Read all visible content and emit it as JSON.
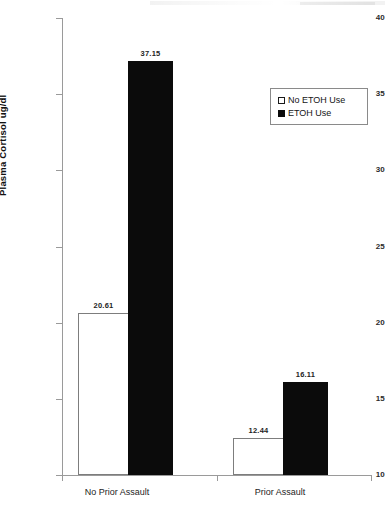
{
  "chart_data": {
    "type": "bar",
    "title": "",
    "subtitle": "",
    "xlabel": "",
    "ylabel": "Plasma Cortisol ug/dl",
    "categories": [
      "No Prior Assault",
      "Prior Assault"
    ],
    "series": [
      {
        "name": "No ETOH Use",
        "values": [
          20.61,
          12.44
        ],
        "fill": "#ffffff",
        "stroke": "#7d7d7d"
      },
      {
        "name": "ETOH Use",
        "values": [
          37.15,
          16.11
        ],
        "fill": "#0b0b0b",
        "stroke": "#0b0b0b"
      }
    ],
    "data_labels": [
      {
        "series": "No ETOH Use",
        "category": "No Prior Assault",
        "text": "20.61"
      },
      {
        "series": "ETOH Use",
        "category": "No Prior Assault",
        "text": "37.15"
      },
      {
        "series": "No ETOH Use",
        "category": "Prior Assault",
        "text": "12.44"
      },
      {
        "series": "ETOH Use",
        "category": "Prior Assault",
        "text": "16.11"
      }
    ],
    "ylim": [
      10,
      40
    ],
    "ytick_step": 5,
    "yticks": [
      40,
      35,
      30,
      25,
      20,
      15,
      10
    ],
    "ytick_labels": [
      "40",
      "35",
      "30",
      "25",
      "20",
      "15",
      "10"
    ],
    "grid": false,
    "legend_position": "top-right",
    "axis_color": "#9a9a9a"
  },
  "legend": {
    "items": [
      {
        "label": "No ETOH Use",
        "marker": "hollow-square-icon"
      },
      {
        "label": "ETOH Use",
        "marker": "filled-square-icon"
      }
    ]
  }
}
